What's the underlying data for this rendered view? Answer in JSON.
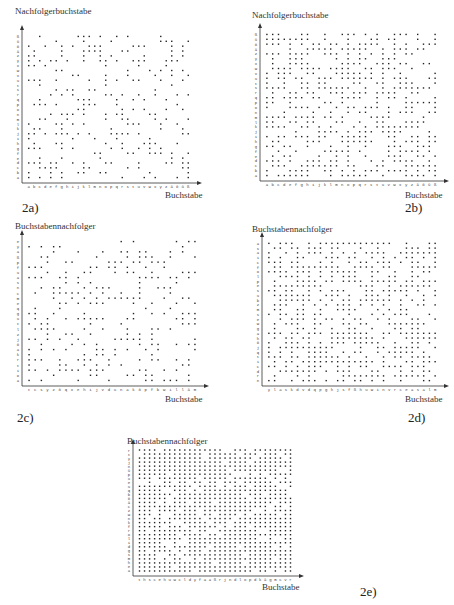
{
  "chart_data": [
    {
      "id": "2a",
      "type": "scatter",
      "panel_label": "2a)",
      "ylabel": "Nachfolgerbuchstabe",
      "xlabel": "Buchstabe",
      "x_categories": [
        "a",
        "b",
        "c",
        "d",
        "e",
        "f",
        "g",
        "h",
        "i",
        "j",
        "k",
        "l",
        "m",
        "n",
        "o",
        "p",
        "q",
        "r",
        "s",
        "t",
        "u",
        "v",
        "w",
        "x",
        "y",
        "z",
        "ä",
        "ö",
        "ü",
        "ß"
      ],
      "y_categories": [
        "a",
        "b",
        "c",
        "d",
        "e",
        "f",
        "g",
        "h",
        "i",
        "j",
        "k",
        "l",
        "m",
        "n",
        "o",
        "p",
        "q",
        "r",
        "s",
        "t",
        "u",
        "v",
        "w",
        "x",
        "y",
        "z",
        "ä",
        "ö",
        "ü",
        "ß"
      ],
      "description": "Binary occurrence matrix: dot where letter (x) is followed by successor letter (y); sparse pattern",
      "density": 0.32,
      "seed": 11
    },
    {
      "id": "2b",
      "type": "scatter",
      "panel_label": "2b)",
      "ylabel": "Nachfolgerbuchstabe",
      "xlabel": "Buchstabe",
      "x_categories": [
        "a",
        "b",
        "c",
        "d",
        "e",
        "f",
        "g",
        "h",
        "i",
        "j",
        "k",
        "l",
        "m",
        "n",
        "o",
        "p",
        "q",
        "r",
        "s",
        "t",
        "u",
        "v",
        "w",
        "x",
        "y",
        "z",
        "ä",
        "ö",
        "ü",
        "ß"
      ],
      "y_categories": [
        "a",
        "b",
        "c",
        "d",
        "e",
        "f",
        "g",
        "h",
        "i",
        "j",
        "k",
        "l",
        "m",
        "n",
        "o",
        "p",
        "q",
        "r",
        "s",
        "t",
        "u",
        "v",
        "w",
        "x",
        "y",
        "z",
        "ä",
        "ö",
        "ü",
        "ß"
      ],
      "description": "Binary occurrence matrix with larger text sample; denser pattern",
      "density": 0.55,
      "seed": 23
    },
    {
      "id": "2c",
      "type": "scatter",
      "panel_label": "2c)",
      "ylabel": "Buchstabennachfolger",
      "xlabel": "Buchstabe",
      "x_categories": [
        "t",
        "c",
        "s",
        "y",
        "z",
        "ö",
        "q",
        "x",
        "e",
        "h",
        "i",
        "j",
        "v",
        "d",
        "u",
        "n",
        "a",
        "k",
        "ö",
        "p",
        "f",
        "b",
        "w",
        "i",
        "l",
        "l",
        "ä",
        "m"
      ],
      "y_categories": [
        "a",
        "o",
        "i",
        "t",
        "r",
        "k",
        "a",
        "ö",
        "j",
        "z",
        "l",
        "t",
        "u",
        "g",
        "q",
        "e",
        "m",
        "c",
        "n",
        "s",
        "a",
        "u",
        "f",
        "p",
        "ß",
        "a",
        "y",
        "e"
      ],
      "description": "Reordered occurrence matrix (sorted axes); sparse pattern trending lower-left",
      "density": 0.34,
      "seed": 37
    },
    {
      "id": "2d",
      "type": "scatter",
      "panel_label": "2d)",
      "ylabel": "Buchstabennachfolger",
      "xlabel": "Buchstabe",
      "x_categories": [
        "y",
        "l",
        "a",
        "s",
        "k",
        "d",
        "v",
        "d",
        "q",
        "p",
        "g",
        "h",
        "j",
        "s",
        "f",
        "ß",
        "h",
        "u",
        "w",
        "i",
        "n",
        "v",
        "r",
        "c",
        "e",
        "a",
        "s",
        "a",
        "l",
        "m"
      ],
      "y_categories": [
        "n",
        "r",
        "d",
        "c",
        "i",
        "t",
        "q",
        "j",
        "ö",
        "h",
        "a",
        "g",
        "w",
        "e",
        "s",
        "m",
        "z",
        "b",
        "u",
        "s",
        "e",
        "p",
        "l",
        "o",
        "f",
        "c",
        "i",
        "a",
        "s",
        "a"
      ],
      "description": "Reordered occurrence matrix with larger sample; dense pattern",
      "density": 0.6,
      "seed": 41
    },
    {
      "id": "2e",
      "type": "scatter",
      "panel_label": "2e)",
      "ylabel": "Buchstabennachfolger",
      "xlabel": "Buchstabe",
      "x_categories": [
        "t",
        "h",
        "s",
        "c",
        "e",
        "h",
        "u",
        "w",
        "c",
        "l",
        "d",
        "y",
        "f",
        "a",
        "a",
        "ß",
        "r",
        "j",
        "n",
        "d",
        "l",
        "o",
        "p",
        "d",
        "k",
        "ä",
        "g",
        "m",
        "c",
        "v",
        "r"
      ],
      "y_categories": [
        "a",
        "e",
        "h",
        "m",
        "s",
        "g",
        "d",
        "i",
        "l",
        "o",
        "r",
        "f",
        "k",
        "n",
        "w",
        "z",
        "c",
        "ä",
        "ö",
        "b",
        "q",
        "u",
        "e",
        "u",
        "p",
        "ü",
        "n",
        "j",
        "y",
        "t",
        "r"
      ],
      "description": "Reordered occurrence matrix with full sample; nearly saturated grid",
      "density": 0.85,
      "seed": 53
    }
  ],
  "layout": {
    "panels": [
      {
        "ox": 22,
        "oy": 183,
        "w": 171,
        "h": 150,
        "title_x": 15,
        "title_y": 6,
        "xl_x": 165,
        "xl_y": 190,
        "tag_x": 22,
        "tag_y": 200
      },
      {
        "ox": 260,
        "oy": 181,
        "w": 180,
        "h": 150,
        "title_x": 252,
        "title_y": 10,
        "xl_x": 405,
        "xl_y": 190,
        "tag_x": 405,
        "tag_y": 200
      },
      {
        "ox": 22,
        "oy": 386,
        "w": 178,
        "h": 148,
        "title_x": 15,
        "title_y": 221,
        "xl_x": 165,
        "xl_y": 394,
        "tag_x": 17,
        "tag_y": 410
      },
      {
        "ox": 262,
        "oy": 386,
        "w": 178,
        "h": 146,
        "title_x": 252,
        "title_y": 224,
        "xl_x": 405,
        "xl_y": 394,
        "tag_x": 408,
        "tag_y": 410
      },
      {
        "ox": 133,
        "oy": 576,
        "w": 162,
        "h": 129,
        "title_x": 127,
        "title_y": 436,
        "xl_x": 262,
        "xl_y": 582,
        "tag_x": 360,
        "tag_y": 584
      }
    ]
  }
}
